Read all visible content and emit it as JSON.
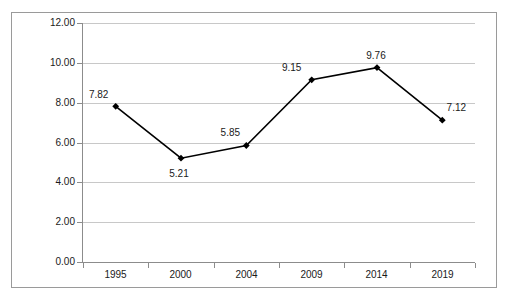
{
  "chart_data": {
    "type": "line",
    "title": "",
    "subtitle": "",
    "xlabel": "",
    "ylabel": "",
    "categories": [
      "1995",
      "2000",
      "2004",
      "2009",
      "2014",
      "2019"
    ],
    "values": [
      7.82,
      5.21,
      5.85,
      9.15,
      9.76,
      7.12
    ],
    "point_labels": [
      "7.82",
      "5.21",
      "5.85",
      "9.15",
      "9.76",
      "7.12"
    ],
    "series": [
      {
        "name": "",
        "values": [
          7.82,
          5.21,
          5.85,
          9.15,
          9.76,
          7.12
        ]
      }
    ],
    "ylim": [
      0.0,
      12.0
    ],
    "ytick_step": 2.0,
    "ytick_labels": [
      "12.00",
      "10.00",
      "8.00",
      "6.00",
      "4.00",
      "2.00",
      "0.00"
    ],
    "ytick_values": [
      12.0,
      10.0,
      8.0,
      6.0,
      4.0,
      2.0,
      0.0
    ],
    "grid": "horizontal",
    "legend": "none",
    "marker": "diamond",
    "colors": {
      "line": "#000000",
      "marker": "#000000",
      "gridline": "#c8c8c8",
      "axis": "#8c8c8c",
      "border": "#9a9a9a",
      "text": "#1a1a1a",
      "background": "#ffffff"
    }
  }
}
